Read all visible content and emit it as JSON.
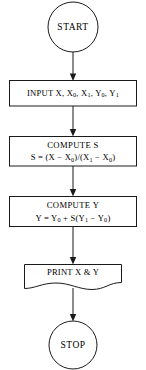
{
  "diagram": {
    "background_color": "#ffffff",
    "line_color": "#1a1a1a",
    "text_color": "#000000"
  },
  "nodes": {
    "start": {
      "label": "START",
      "shape": "circle"
    },
    "input": {
      "shape": "rectangle",
      "text_prefix": "INPUT X, X",
      "sub1": "0",
      "mid1": ", X",
      "sub2": "1",
      "mid2": ", Y",
      "sub3": "0",
      "mid3": ", Y",
      "sub4": "1"
    },
    "compute_s": {
      "shape": "rectangle",
      "title": "COMPUTE S",
      "formula_a": "S = (X − X",
      "formula_sub1": "0",
      "formula_b": ")/(X",
      "formula_sub2": "1",
      "formula_c": " − X",
      "formula_sub3": "0",
      "formula_d": ")"
    },
    "compute_y": {
      "shape": "rectangle",
      "title": "COMPUTE Y",
      "formula_a": "Y = Y",
      "formula_sub1": "0",
      "formula_b": " + S(Y",
      "formula_sub2": "1",
      "formula_c": " − Y",
      "formula_sub3": "0",
      "formula_d": ")"
    },
    "print": {
      "shape": "document",
      "label": "PRINT X & Y"
    },
    "stop": {
      "label": "STOP",
      "shape": "circle"
    }
  },
  "connectors": [
    {
      "name": "start-to-input",
      "from": "start",
      "to": "input",
      "arrow": true
    },
    {
      "name": "input-to-compute-s",
      "from": "input",
      "to": "compute_s",
      "arrow": true
    },
    {
      "name": "compute-s-to-compute-y",
      "from": "compute_s",
      "to": "compute_y",
      "arrow": true
    },
    {
      "name": "compute-y-to-print",
      "from": "compute_y",
      "to": "print",
      "arrow": true
    },
    {
      "name": "print-to-stop",
      "from": "print",
      "to": "stop",
      "arrow": true
    }
  ]
}
